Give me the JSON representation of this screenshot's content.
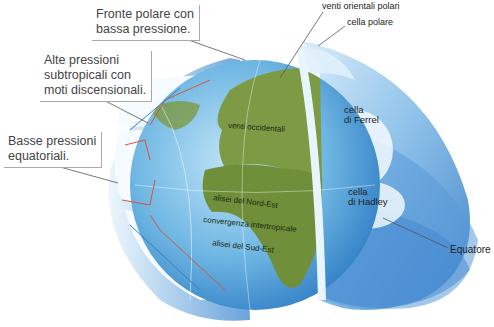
{
  "callouts": {
    "polar_front": [
      "Fronte polare con",
      "bassa pressione."
    ],
    "subtropical_high": [
      "Alte pressioni",
      "subtropicali con",
      "moti discensionali."
    ],
    "equatorial_low": [
      "Basse pressioni",
      "equatoriali."
    ]
  },
  "labels": {
    "polar_easterlies": "venti orientali polari",
    "polar_cell": "cella polare",
    "ferrel_cell": [
      "cella",
      "di Ferrel"
    ],
    "hadley_cell": [
      "cella",
      "di Hadley"
    ],
    "equator": "Equatore"
  },
  "map_labels": {
    "westerlies": "venti occidentali",
    "ne_trades": "alisei del Nord-Est",
    "itcz": "convergenza intertropicale",
    "se_trades": "alisei del Sud-Est"
  },
  "colors": {
    "ocean": "#5aa8dc",
    "land": "#6f8f3a",
    "cell_blue": "#3f86cf",
    "arrow_red": "#d9553a",
    "arrow_blue": "#3a7fc0"
  }
}
